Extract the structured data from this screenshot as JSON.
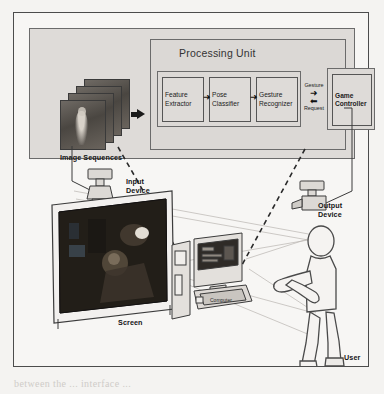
{
  "figure": {
    "type": "system-architecture-diagram",
    "title_block": "Processing Unit",
    "pipeline": [
      {
        "id": "feature-extractor",
        "line1": "Feature",
        "line2": "Extractor"
      },
      {
        "id": "pose-classifier",
        "line1": "Pose",
        "line2": "Classifier"
      },
      {
        "id": "gesture-recognizer",
        "line1": "Gesture",
        "line2": "Recognizer"
      }
    ],
    "controller": {
      "id": "game-controller",
      "line1": "Game",
      "line2": "Controller"
    },
    "exchange": {
      "out_label": "Gesture",
      "out_arrow": "➜",
      "in_label": "Request",
      "in_arrow": "⬅"
    },
    "input_stack_label": "Image Sequences",
    "pipeline_arrow": "➜"
  },
  "scene": {
    "input_device": {
      "line1": "Input",
      "line2": "Device"
    },
    "output_device": {
      "line1": "Output",
      "line2": "Device"
    },
    "screen_label": "Screen",
    "user_label": "User",
    "computer_badge": "Computer"
  },
  "colors": {
    "panel_fill": "#dedbd8",
    "page_bg": "#f4f3f1",
    "frame_stroke": "#4c4c4c",
    "box_stroke": "#555555",
    "text": "#141414",
    "screen_dark": "#1b1713"
  },
  "bleed_text": {
    "l1": "the world. Through this approach",
    "l2": "to model ... of hand gestures",
    "l3": "for smooth and different",
    "l4": "interaction and ...",
    "l5": "between the ... interface ...",
    "l6": "",
    "l7": ""
  }
}
